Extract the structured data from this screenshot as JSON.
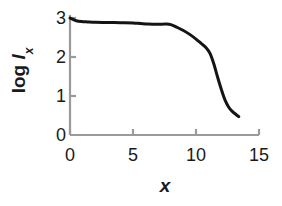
{
  "chart_data": {
    "type": "line",
    "title": "",
    "subtitle": "",
    "xlabel": "x",
    "ylabel": "log l_x",
    "ylabel_parts": {
      "prefix": "log ",
      "symbol": "l",
      "subscript": "x"
    },
    "xlim": [
      0,
      15
    ],
    "ylim": [
      0,
      3.15
    ],
    "xticks": [
      0,
      5,
      10,
      15
    ],
    "yticks": [
      0,
      1,
      2,
      3
    ],
    "xtick_labels": [
      "0",
      "5",
      "10",
      "15"
    ],
    "ytick_labels": [
      "0",
      "1",
      "2",
      "3"
    ],
    "grid": false,
    "legend": false,
    "legend_position": "none",
    "series": [
      {
        "name": "log lx",
        "color": "#141414",
        "line_width": 3,
        "x": [
          0.0,
          0.2,
          0.5,
          0.9,
          1.4,
          2.0,
          3.0,
          4.0,
          5.0,
          5.6,
          6.2,
          7.0,
          7.6,
          8.0,
          8.5,
          9.0,
          9.5,
          10.0,
          10.4,
          10.8,
          11.1,
          11.4,
          11.7,
          12.0,
          12.3,
          12.6,
          12.9,
          13.2,
          13.4
        ],
        "y": [
          3.0,
          2.97,
          2.93,
          2.91,
          2.9,
          2.89,
          2.885,
          2.88,
          2.875,
          2.86,
          2.845,
          2.84,
          2.845,
          2.83,
          2.76,
          2.68,
          2.58,
          2.46,
          2.35,
          2.24,
          2.1,
          1.84,
          1.5,
          1.18,
          0.9,
          0.71,
          0.6,
          0.52,
          0.47
        ]
      }
    ],
    "axis_color": "#9a9a9a",
    "text_color": "#1a1a1a",
    "background": "#ffffff"
  },
  "axes": {
    "x_label": "x",
    "y_label_prefix": "log ",
    "y_label_symbol": "l",
    "y_label_subscript": "x"
  },
  "ticks": {
    "x": [
      {
        "value": 0,
        "label": "0"
      },
      {
        "value": 5,
        "label": "5"
      },
      {
        "value": 10,
        "label": "10"
      },
      {
        "value": 15,
        "label": "15"
      }
    ],
    "y": [
      {
        "value": 0,
        "label": "0"
      },
      {
        "value": 1,
        "label": "1"
      },
      {
        "value": 2,
        "label": "2"
      },
      {
        "value": 3,
        "label": "3"
      }
    ]
  }
}
